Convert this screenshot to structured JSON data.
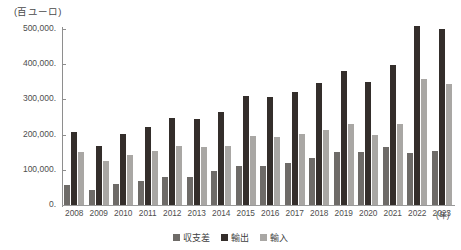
{
  "chart_data": {
    "type": "bar",
    "title": "",
    "subtitle": "",
    "unit_caption": "(百ユーロ)",
    "xlabel": "(年)",
    "ylabel": "",
    "ylim": [
      0,
      500000
    ],
    "yticks": [
      0,
      100000,
      200000,
      300000,
      400000,
      500000
    ],
    "ytick_labels": [
      "0.",
      "100,000.",
      "200,000.",
      "300,000.",
      "400,000.",
      "500,000."
    ],
    "grid": false,
    "legend_position": "bottom",
    "categories": [
      "2008",
      "2009",
      "2010",
      "2011",
      "2012",
      "2013",
      "2014",
      "2015",
      "2016",
      "2017",
      "2018",
      "2019",
      "2020",
      "2021",
      "2022",
      "2023"
    ],
    "series": [
      {
        "name": "収支差",
        "color": "#6e6b68",
        "values": [
          57000,
          42000,
          61000,
          67000,
          80000,
          79000,
          97000,
          112000,
          112000,
          120000,
          134000,
          150000,
          151000,
          165000,
          148000,
          154000
        ]
      },
      {
        "name": "輸出",
        "color": "#342e2b",
        "values": [
          207000,
          169000,
          203000,
          221000,
          248000,
          245000,
          265000,
          309000,
          306000,
          321000,
          348000,
          382000,
          350000,
          397000,
          508000,
          499000
        ]
      },
      {
        "name": "輸入",
        "color": "#a9a7a4",
        "values": [
          150000,
          126000,
          141000,
          154000,
          167000,
          164000,
          168000,
          196000,
          194000,
          201000,
          214000,
          231000,
          199000,
          231000,
          357000,
          344000
        ]
      }
    ]
  },
  "legend": {
    "items": [
      {
        "label": "収支差",
        "color": "#6e6b68"
      },
      {
        "label": "輸出",
        "color": "#342e2b"
      },
      {
        "label": "輸入",
        "color": "#a9a7a4"
      }
    ]
  }
}
